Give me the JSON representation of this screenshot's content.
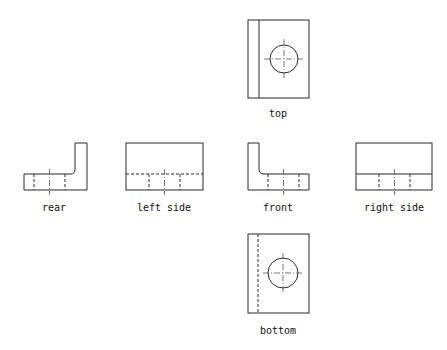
{
  "diagram": {
    "line_color": "#2a2a2a",
    "views": [
      {
        "id": "top",
        "label": "top"
      },
      {
        "id": "rear",
        "label": "rear"
      },
      {
        "id": "left",
        "label": "left side"
      },
      {
        "id": "front",
        "label": "front"
      },
      {
        "id": "right",
        "label": "right side"
      },
      {
        "id": "bottom",
        "label": "bottom"
      }
    ]
  }
}
